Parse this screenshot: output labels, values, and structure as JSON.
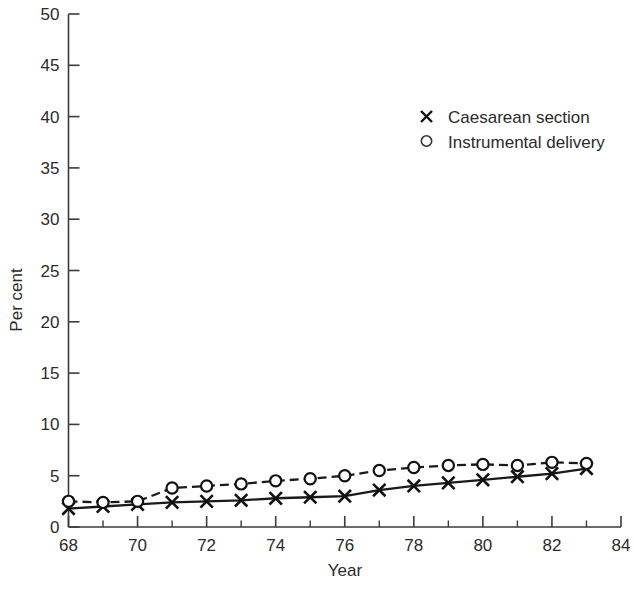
{
  "chart_data": {
    "type": "line",
    "title": "",
    "xlabel": "Year",
    "ylabel": "Per cent",
    "xlim": [
      68,
      84
    ],
    "ylim": [
      0,
      50
    ],
    "grid": false,
    "legend_position": "upper-center-right",
    "x": [
      68,
      69,
      70,
      71,
      72,
      73,
      74,
      75,
      76,
      77,
      78,
      79,
      80,
      81,
      82,
      83
    ],
    "xtick_labels": [
      "68",
      "70",
      "72",
      "74",
      "76",
      "78",
      "80",
      "82",
      "84"
    ],
    "xtick_values": [
      68,
      70,
      72,
      74,
      76,
      78,
      80,
      82,
      84
    ],
    "xtick_minor_values": [
      69,
      71,
      73,
      75,
      77,
      79,
      81,
      83
    ],
    "ytick_labels": [
      "0",
      "5",
      "10",
      "15",
      "20",
      "25",
      "30",
      "35",
      "40",
      "45",
      "50"
    ],
    "ytick_values": [
      0,
      5,
      10,
      15,
      20,
      25,
      30,
      35,
      40,
      45,
      50
    ],
    "series": [
      {
        "name": "Caesarean section",
        "marker": "x",
        "linestyle": "solid",
        "values": [
          1.8,
          2.0,
          2.2,
          2.4,
          2.5,
          2.6,
          2.8,
          2.9,
          3.0,
          3.6,
          4.0,
          4.3,
          4.6,
          4.9,
          5.2,
          5.7
        ]
      },
      {
        "name": "Instrumental delivery",
        "marker": "o",
        "linestyle": "dashed",
        "values": [
          2.5,
          2.4,
          2.5,
          3.8,
          4.0,
          4.2,
          4.5,
          4.7,
          5.0,
          5.5,
          5.8,
          6.0,
          6.1,
          6.0,
          6.3,
          6.2
        ]
      }
    ]
  },
  "legend": {
    "items": [
      {
        "label": "Caesarean section",
        "marker": "x"
      },
      {
        "label": "Instrumental delivery",
        "marker": "o"
      }
    ]
  },
  "colors": {
    "ink": "#231f20",
    "axis": "#3b3b3b",
    "series": "#111111",
    "background": "#ffffff"
  }
}
